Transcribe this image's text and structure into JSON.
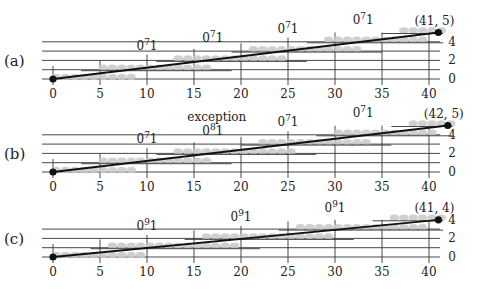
{
  "figure": {
    "panels": [
      {
        "id": "a",
        "label": "(a)",
        "endpoint_label": "(41, 5)",
        "end_x": 41,
        "end_y": 5,
        "segment_labels": [
          {
            "x": 10,
            "text": "0",
            "sup": "7",
            "tail": "1"
          },
          {
            "x": 17,
            "text": "0",
            "sup": "7",
            "tail": "1"
          },
          {
            "x": 25,
            "text": "0",
            "sup": "7",
            "tail": "1"
          },
          {
            "x": 33,
            "text": "0",
            "sup": "7",
            "tail": "1"
          }
        ],
        "steps": [
          {
            "x0": 0,
            "x1": 8,
            "y": 0
          },
          {
            "x0": 5,
            "x1": 16,
            "y": 1
          },
          {
            "x0": 13,
            "x1": 24,
            "y": 2
          },
          {
            "x0": 21,
            "x1": 32,
            "y": 3
          },
          {
            "x0": 29,
            "x1": 39,
            "y": 4
          },
          {
            "x0": 37,
            "x1": 41,
            "y": 5
          }
        ],
        "annotation": ""
      },
      {
        "id": "b",
        "label": "(b)",
        "endpoint_label": "(42, 5)",
        "end_x": 42,
        "end_y": 5,
        "segment_labels": [
          {
            "x": 10,
            "text": "0",
            "sup": "7",
            "tail": "1"
          },
          {
            "x": 17,
            "text": "0",
            "sup": "8",
            "tail": "1"
          },
          {
            "x": 25,
            "text": "0",
            "sup": "7",
            "tail": "1"
          },
          {
            "x": 33,
            "text": "0",
            "sup": "7",
            "tail": "1"
          }
        ],
        "steps": [
          {
            "x0": 0,
            "x1": 8,
            "y": 0
          },
          {
            "x0": 5,
            "x1": 16,
            "y": 1
          },
          {
            "x0": 13,
            "x1": 25,
            "y": 2
          },
          {
            "x0": 22,
            "x1": 33,
            "y": 3
          },
          {
            "x0": 30,
            "x1": 40,
            "y": 4
          },
          {
            "x0": 38,
            "x1": 42,
            "y": 5
          }
        ],
        "annotation": "exception"
      },
      {
        "id": "c",
        "label": "(c)",
        "endpoint_label": "(41, 4)",
        "end_x": 41,
        "end_y": 4,
        "segment_labels": [
          {
            "x": 10,
            "text": "0",
            "sup": "9",
            "tail": "1"
          },
          {
            "x": 20,
            "text": "0",
            "sup": "9",
            "tail": "1"
          },
          {
            "x": 30,
            "text": "0",
            "sup": "9",
            "tail": "1"
          }
        ],
        "steps": [
          {
            "x0": 0,
            "x1": 9,
            "y": 0
          },
          {
            "x0": 6,
            "x1": 19,
            "y": 1
          },
          {
            "x0": 16,
            "x1": 29,
            "y": 2
          },
          {
            "x0": 26,
            "x1": 39,
            "y": 3
          },
          {
            "x0": 36,
            "x1": 41,
            "y": 4
          }
        ],
        "annotation": ""
      }
    ],
    "x_ticks": [
      "0",
      "5",
      "10",
      "15",
      "20",
      "25",
      "30",
      "35",
      "40"
    ],
    "y_ticks": [
      "0",
      "2",
      "4"
    ],
    "colors": {
      "line": "#111111",
      "grid": "#333333",
      "dots": "#c8c8c8",
      "text": "#222222"
    }
  }
}
